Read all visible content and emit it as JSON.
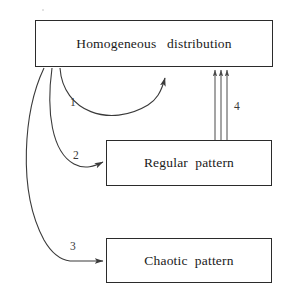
{
  "figure": {
    "type": "flow-diagram",
    "background_color": "#ffffff",
    "stroke_color": "#2b2b2b",
    "text_color": "#1a1a1a"
  },
  "nodes": [
    {
      "id": "homogeneous-distribution",
      "label": "Homogeneous   distribution",
      "x": 35,
      "y": 20,
      "w": 238,
      "h": 47
    },
    {
      "id": "regular-pattern",
      "label": "Regular  pattern",
      "x": 106,
      "y": 140,
      "w": 166,
      "h": 46
    },
    {
      "id": "chaotic-pattern",
      "label": "Chaotic  pattern",
      "x": 106,
      "y": 238,
      "w": 166,
      "h": 45
    }
  ],
  "edges": [
    {
      "id": "edge-1",
      "label": "1",
      "from": "homogeneous-distribution",
      "to": "homogeneous-distribution",
      "label_x": 70,
      "label_y": 97,
      "description": "self loop from bottom of homogeneous distribution back to its bottom edge"
    },
    {
      "id": "edge-2",
      "label": "2",
      "from": "homogeneous-distribution",
      "to": "regular-pattern",
      "label_x": 73,
      "label_y": 150,
      "description": "curve from bottom of homogeneous distribution to left edge of regular pattern"
    },
    {
      "id": "edge-3",
      "label": "3",
      "from": "homogeneous-distribution",
      "to": "chaotic-pattern",
      "label_x": 70,
      "label_y": 241,
      "description": "long curve sweeping left from homogeneous distribution to left edge of chaotic pattern"
    },
    {
      "id": "edge-4",
      "label": "4",
      "from": "regular-pattern",
      "to": "homogeneous-distribution",
      "label_x": 234,
      "label_y": 101,
      "description": "three parallel vertical arrows from top of regular pattern up to bottom of homogeneous distribution"
    }
  ]
}
